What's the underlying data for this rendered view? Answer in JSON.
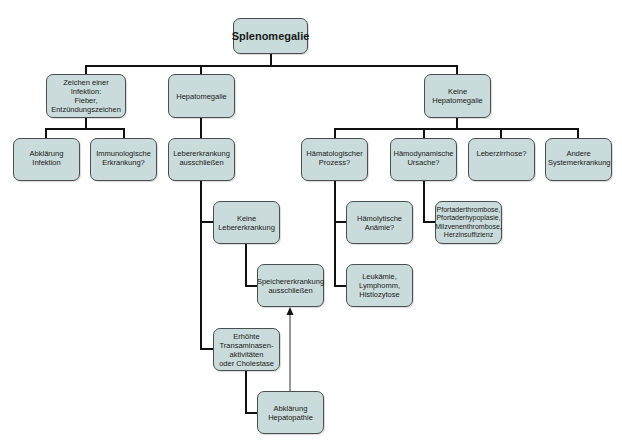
{
  "diagram": {
    "type": "flowchart",
    "language": "de",
    "root": {
      "id": "splenomegalie",
      "label": "Splenomegalie"
    },
    "nodes": [
      {
        "id": "infektion",
        "label": "Zeichen einer Infektion:\nFieber,\nEntzündungszeichen"
      },
      {
        "id": "hepatomegalie",
        "label": "Hepatomegalie"
      },
      {
        "id": "keine_hepatomegalie",
        "label": "Keine\nHepatomegalie"
      },
      {
        "id": "abklaerung_infektion",
        "label": "Abklärung Infektion"
      },
      {
        "id": "immunologische",
        "label": "Immunologische\nErkrankung?"
      },
      {
        "id": "lebererkrankung_ausschliessen",
        "label": "Lebererkrankung\nausschließen"
      },
      {
        "id": "haematologischer",
        "label": "Hämatologischer\nProzess?"
      },
      {
        "id": "haemodynamische",
        "label": "Hämodynamische\nUrsache?"
      },
      {
        "id": "leberzirrhose",
        "label": "Leberzirrhose?"
      },
      {
        "id": "andere",
        "label": "Andere\nSystemerkrankung"
      },
      {
        "id": "keine_lebererkrankung",
        "label": "Keine\nLebererkrankung"
      },
      {
        "id": "haemolytische",
        "label": "Hämolytische\nAnämie?"
      },
      {
        "id": "pfortader",
        "label": "Pfortaderthrombose,\nPfortaderhypoplasie,\nMilzvenenthrombose,\nHerzinsuffizienz"
      },
      {
        "id": "speicher",
        "label": "Speichererkrankung\nausschließen"
      },
      {
        "id": "leukaemie",
        "label": "Leukämie,\nLymphomm,\nHistiozytose"
      },
      {
        "id": "erhoehte",
        "label": "Erhöhte\nTransaminasen-\naktivitäten\noder Cholestase"
      },
      {
        "id": "abklaerung_hepatopathie",
        "label": "Abklärung\nHepatopathie"
      }
    ],
    "edges": [
      {
        "from": "splenomegalie",
        "to": "infektion"
      },
      {
        "from": "splenomegalie",
        "to": "hepatomegalie"
      },
      {
        "from": "splenomegalie",
        "to": "keine_hepatomegalie"
      },
      {
        "from": "infektion",
        "to": "abklaerung_infektion"
      },
      {
        "from": "infektion",
        "to": "immunologische"
      },
      {
        "from": "hepatomegalie",
        "to": "lebererkrankung_ausschliessen"
      },
      {
        "from": "lebererkrankung_ausschliessen",
        "to": "keine_lebererkrankung"
      },
      {
        "from": "lebererkrankung_ausschliessen",
        "to": "erhoehte"
      },
      {
        "from": "keine_lebererkrankung",
        "to": "speicher"
      },
      {
        "from": "erhoehte",
        "to": "abklaerung_hepatopathie"
      },
      {
        "from": "abklaerung_hepatopathie",
        "to": "speicher",
        "style": "thin-arrow"
      },
      {
        "from": "keine_hepatomegalie",
        "to": "haematologischer"
      },
      {
        "from": "keine_hepatomegalie",
        "to": "haemodynamische"
      },
      {
        "from": "keine_hepatomegalie",
        "to": "leberzirrhose"
      },
      {
        "from": "keine_hepatomegalie",
        "to": "andere"
      },
      {
        "from": "haematologischer",
        "to": "haemolytische"
      },
      {
        "from": "haematologischer",
        "to": "leukaemie"
      },
      {
        "from": "haemodynamische",
        "to": "pfortader"
      }
    ]
  },
  "colors": {
    "box_fill": "#c9dcdb",
    "box_border": "#4a4f4f",
    "connector": "#111111"
  }
}
